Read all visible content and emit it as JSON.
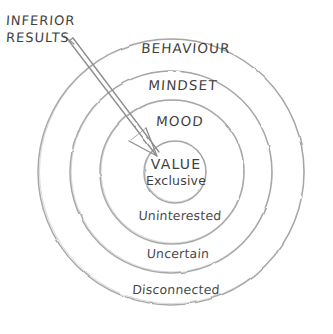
{
  "diagram": {
    "title_callout": {
      "line1": "INFERIOR",
      "line2": "RESULTS",
      "name": "inferior-results-callout"
    },
    "center": {
      "x": 171,
      "y": 172
    },
    "stroke_color": "#a0a0a0",
    "text_color": "#3f3f3f",
    "background": "#ffffff",
    "rings": [
      {
        "label": "BEHAVIOUR",
        "radius": 133,
        "label_x": 186,
        "label_y": 47,
        "case": "upper"
      },
      {
        "label": "MINDSET",
        "radius": 101,
        "label_x": 183,
        "label_y": 84,
        "case": "upper"
      },
      {
        "label": "MOOD",
        "radius": 72,
        "label_x": 180,
        "label_y": 120,
        "case": "upper"
      },
      {
        "label": "Uninterested",
        "radius": 72,
        "label_x": 180,
        "label_y": 214,
        "case": "lower"
      },
      {
        "label": "Uncertain",
        "radius": 101,
        "label_x": 178,
        "label_y": 252,
        "case": "lower"
      },
      {
        "label": "Disconnected",
        "radius": 133,
        "label_x": 176,
        "label_y": 288,
        "case": "lower"
      }
    ],
    "core": {
      "radius": 31,
      "center_x": 175,
      "center_y": 172,
      "title": "VALUE",
      "subtitle": "Exclusive"
    },
    "arrow": {
      "name": "inferior-results-arrow",
      "from_x": 69,
      "from_y": 42,
      "to_x": 157,
      "to_y": 156
    }
  }
}
